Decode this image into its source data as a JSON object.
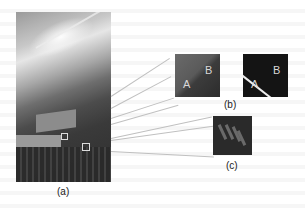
{
  "figure": {
    "panel_a": {
      "caption": "(a)",
      "description": "Photo of city rooftop view with sun glare and two marked patches"
    },
    "panel_b": {
      "caption": "(b)",
      "left_patch": {
        "label_a": "A",
        "label_b": "B"
      },
      "right_patch": {
        "label_a": "A",
        "label_b": "B"
      }
    },
    "panel_c": {
      "caption": "(c)"
    }
  },
  "colors": {
    "leader_line": "#c0c0c0",
    "marker": "#dddddd",
    "edge_line": "#eeeeee"
  }
}
